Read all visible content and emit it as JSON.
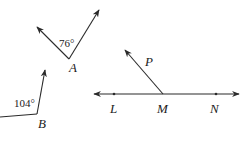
{
  "diagram": {
    "stroke_color": "#2a2a2a",
    "angle_A": {
      "vertex_label": "A",
      "measure": "76°"
    },
    "angle_B": {
      "vertex_label": "B",
      "measure": "104°"
    },
    "line_LMN": {
      "points": [
        "L",
        "M",
        "N"
      ],
      "ray_label": "P"
    }
  }
}
